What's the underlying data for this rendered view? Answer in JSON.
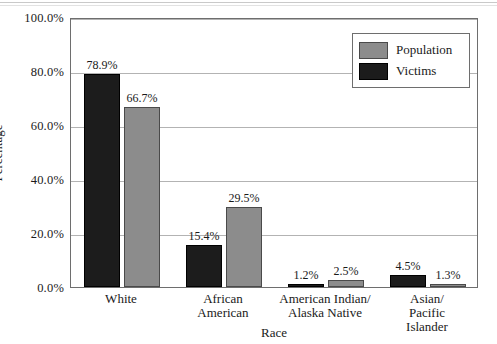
{
  "chart_data": {
    "type": "bar",
    "title": "",
    "xlabel": "Race",
    "ylabel": "Percentage",
    "categories": [
      "White",
      "African\nAmerican",
      "American Indian/\nAlaska Native",
      "Asian/\nPacific Islander"
    ],
    "series": [
      {
        "name": "Victims",
        "color": "#1c1c1c",
        "values": [
          78.9,
          15.4,
          1.2,
          4.5
        ],
        "labels": [
          "78.9%",
          "15.4%",
          "1.2%",
          "4.5%"
        ]
      },
      {
        "name": "Population",
        "color": "#8c8c8c",
        "values": [
          66.7,
          29.5,
          2.5,
          1.3
        ],
        "labels": [
          "66.7%",
          "29.5%",
          "2.5%",
          "1.3%"
        ]
      }
    ],
    "ylim": [
      0,
      100
    ],
    "yticks": [
      0,
      20,
      40,
      60,
      80,
      100
    ],
    "ytick_labels": [
      "0.0%",
      "20.0%",
      "40.0%",
      "60.0%",
      "80.0%",
      "100.0%"
    ],
    "grid": true,
    "legend_position": "top-right",
    "legend_order": [
      "Population",
      "Victims"
    ]
  },
  "legend": {
    "population_label": "Population",
    "victims_label": "Victims"
  },
  "axes": {
    "x_title": "Race",
    "y_title": "Percentage"
  }
}
